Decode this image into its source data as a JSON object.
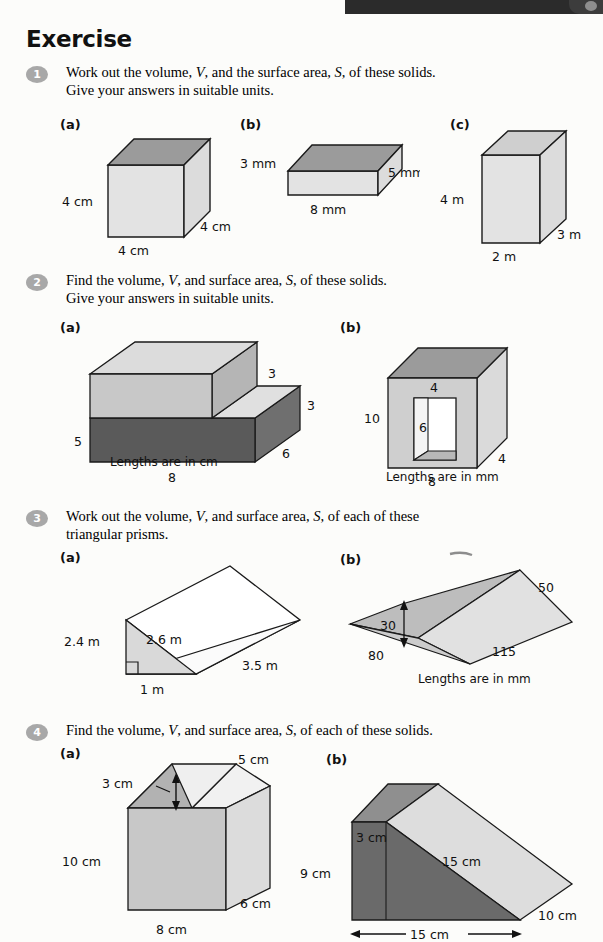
{
  "page": {
    "title": "Exercise",
    "background_color": "#fcfcfa",
    "banner_color": "#2b2b2b"
  },
  "colors": {
    "face_light": "#e3e3e3",
    "face_mid": "#9b9b9b",
    "face_dark": "#5a5a5a",
    "face_pale": "#d8d8d8",
    "outline": "#1a1a1a",
    "marker_gray": "#a8a8a8"
  },
  "questions": [
    {
      "number": "1",
      "text_line1": "Work out the volume, V, and the surface area, S, of these solids.",
      "text_line2": "Give your answers in suitable units.",
      "parts": [
        {
          "label": "(a)",
          "shape": "cube",
          "labels": {
            "height": "4 cm",
            "width": "4 cm",
            "depth": "4 cm"
          }
        },
        {
          "label": "(b)",
          "shape": "cuboid-flat",
          "labels": {
            "height": "3 mm",
            "width": "8 mm",
            "depth": "5 mm"
          }
        },
        {
          "label": "(c)",
          "shape": "cuboid-tall",
          "labels": {
            "height": "4 m",
            "width": "2 m",
            "depth": "3 m"
          }
        }
      ]
    },
    {
      "number": "2",
      "text_line1": "Find the volume, V, and surface area, S, of these solids.",
      "text_line2": "Give your answers in suitable units.",
      "parts": [
        {
          "label": "(a)",
          "shape": "step-prism",
          "caption": "Lengths are in cm",
          "labels": {
            "left_height": "5",
            "step_top": "3",
            "step_right": "3",
            "depth": "6",
            "base_width": "8"
          }
        },
        {
          "label": "(b)",
          "shape": "box-with-hole",
          "caption": "Lengths are in mm",
          "labels": {
            "height": "10",
            "hole_width": "4",
            "hole_height": "6",
            "base_width": "8",
            "depth": "4"
          }
        }
      ]
    },
    {
      "number": "3",
      "text_line1": "Work out the volume, V, and surface area, S, of each of these",
      "text_line2": "triangular prisms.",
      "parts": [
        {
          "label": "(a)",
          "shape": "triangular-prism-upright",
          "labels": {
            "height": "2.4 m",
            "hypotenuse": "2.6 m",
            "length": "3.5 m",
            "base": "1 m"
          }
        },
        {
          "label": "(b)",
          "shape": "triangular-prism-tent",
          "caption": "Lengths are in mm",
          "labels": {
            "slant": "50",
            "apex_height": "30",
            "base_width": "80",
            "length": "115"
          }
        }
      ]
    },
    {
      "number": "4",
      "text_line1": "Find the volume, V, and surface area, S, of each of these solids.",
      "text_line2": "",
      "parts": [
        {
          "label": "(a)",
          "shape": "house-prism",
          "labels": {
            "ridge": "5 cm",
            "roof_height": "3 cm",
            "wall_height": "10 cm",
            "depth": "6 cm",
            "width": "8 cm"
          }
        },
        {
          "label": "(b)",
          "shape": "wedge-ramp",
          "labels": {
            "top_height": "3 cm",
            "front_height": "9 cm",
            "slope": "15 cm",
            "depth": "10 cm",
            "base": "15 cm"
          }
        }
      ]
    }
  ]
}
